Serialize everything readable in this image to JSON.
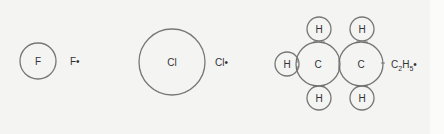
{
  "diagram": {
    "type": "electron-dot radicals",
    "atoms": [
      {
        "id": "fluorine",
        "symbol": "F",
        "radical_label": "F•"
      },
      {
        "id": "chlorine",
        "symbol": "Cl",
        "radical_label": "Cl•"
      },
      {
        "id": "ethyl",
        "carbon_symbol": "C",
        "hydrogen_symbol": "H",
        "radical_label_main": "C",
        "sub1": "2",
        "label_h": "H",
        "sub2": "5",
        "dot": "•"
      }
    ]
  },
  "colors": {
    "background": "#f4f4f3",
    "stroke": "#777777",
    "text": "#333333"
  }
}
